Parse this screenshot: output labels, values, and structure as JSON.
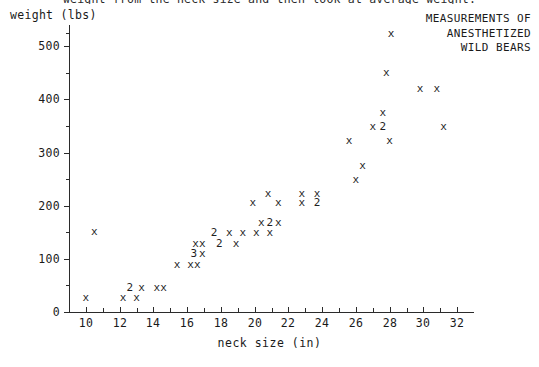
{
  "caption": {
    "clipped_line": "weight from the neck size and then look at average weight."
  },
  "axes": {
    "y_title": "weight (lbs)",
    "x_title": "neck size (in)",
    "y_major_labels": [
      "0",
      "100",
      "200",
      "300",
      "400",
      "500"
    ],
    "x_major_labels": [
      "10",
      "12",
      "14",
      "16",
      "18",
      "20",
      "22",
      "24",
      "26",
      "28",
      "30",
      "32"
    ]
  },
  "title": {
    "line1": "MEASUREMENTS OF",
    "line2": "ANESTHETIZED",
    "line3": "WILD BEARS",
    "legend_marker": "x"
  },
  "chart_data": {
    "type": "scatter",
    "xlabel": "neck size (in)",
    "ylabel": "weight (lbs)",
    "xlim": [
      9,
      33
    ],
    "ylim": [
      0,
      540
    ],
    "grid": false,
    "legend_position": "top-right",
    "marker_symbol": "x",
    "overlap_notation": "A digit (2 or 3) marks that many coincident points",
    "x_ticks": [
      10,
      12,
      14,
      16,
      18,
      20,
      22,
      24,
      26,
      28,
      30,
      32
    ],
    "x_minor_ticks": [
      11,
      13,
      15,
      17,
      19,
      21,
      23,
      25,
      27,
      29,
      31
    ],
    "y_ticks": [
      0,
      100,
      200,
      300,
      400,
      500
    ],
    "y_minor_ticks": [
      50,
      150,
      250,
      350,
      450,
      525
    ],
    "points": [
      {
        "x": 10.0,
        "y": 26,
        "label": "x",
        "count": 1
      },
      {
        "x": 10.5,
        "y": 150,
        "label": "x",
        "count": 1
      },
      {
        "x": 12.2,
        "y": 26,
        "label": "x",
        "count": 1
      },
      {
        "x": 13.0,
        "y": 26,
        "label": "x",
        "count": 1
      },
      {
        "x": 12.6,
        "y": 46,
        "label": "2",
        "count": 2
      },
      {
        "x": 13.3,
        "y": 46,
        "label": "x",
        "count": 1
      },
      {
        "x": 14.2,
        "y": 46,
        "label": "x",
        "count": 1
      },
      {
        "x": 14.6,
        "y": 46,
        "label": "x",
        "count": 1
      },
      {
        "x": 15.4,
        "y": 88,
        "label": "x",
        "count": 1
      },
      {
        "x": 16.2,
        "y": 88,
        "label": "x",
        "count": 1
      },
      {
        "x": 16.6,
        "y": 88,
        "label": "x",
        "count": 1
      },
      {
        "x": 16.4,
        "y": 110,
        "label": "3",
        "count": 3
      },
      {
        "x": 16.9,
        "y": 110,
        "label": "x",
        "count": 1
      },
      {
        "x": 16.5,
        "y": 128,
        "label": "x",
        "count": 1
      },
      {
        "x": 16.9,
        "y": 128,
        "label": "x",
        "count": 1
      },
      {
        "x": 17.9,
        "y": 128,
        "label": "2",
        "count": 2
      },
      {
        "x": 18.9,
        "y": 128,
        "label": "x",
        "count": 1
      },
      {
        "x": 17.6,
        "y": 148,
        "label": "2",
        "count": 2
      },
      {
        "x": 18.5,
        "y": 148,
        "label": "x",
        "count": 1
      },
      {
        "x": 19.3,
        "y": 148,
        "label": "x",
        "count": 1
      },
      {
        "x": 20.1,
        "y": 148,
        "label": "x",
        "count": 1
      },
      {
        "x": 20.9,
        "y": 148,
        "label": "x",
        "count": 1
      },
      {
        "x": 20.4,
        "y": 168,
        "label": "x",
        "count": 1
      },
      {
        "x": 20.9,
        "y": 168,
        "label": "2",
        "count": 2
      },
      {
        "x": 21.4,
        "y": 168,
        "label": "x",
        "count": 1
      },
      {
        "x": 19.9,
        "y": 205,
        "label": "x",
        "count": 1
      },
      {
        "x": 21.4,
        "y": 205,
        "label": "x",
        "count": 1
      },
      {
        "x": 22.8,
        "y": 205,
        "label": "x",
        "count": 1
      },
      {
        "x": 23.7,
        "y": 205,
        "label": "2",
        "count": 2
      },
      {
        "x": 20.8,
        "y": 222,
        "label": "x",
        "count": 1
      },
      {
        "x": 22.8,
        "y": 222,
        "label": "x",
        "count": 1
      },
      {
        "x": 23.7,
        "y": 222,
        "label": "x",
        "count": 1
      },
      {
        "x": 26.0,
        "y": 248,
        "label": "x",
        "count": 1
      },
      {
        "x": 26.4,
        "y": 275,
        "label": "x",
        "count": 1
      },
      {
        "x": 25.6,
        "y": 322,
        "label": "x",
        "count": 1
      },
      {
        "x": 28.0,
        "y": 322,
        "label": "x",
        "count": 1
      },
      {
        "x": 27.0,
        "y": 348,
        "label": "x",
        "count": 1
      },
      {
        "x": 27.6,
        "y": 348,
        "label": "2",
        "count": 2
      },
      {
        "x": 31.2,
        "y": 348,
        "label": "x",
        "count": 1
      },
      {
        "x": 27.6,
        "y": 375,
        "label": "x",
        "count": 1
      },
      {
        "x": 29.8,
        "y": 420,
        "label": "x",
        "count": 1
      },
      {
        "x": 30.8,
        "y": 420,
        "label": "x",
        "count": 1
      },
      {
        "x": 27.8,
        "y": 450,
        "label": "x",
        "count": 1
      }
    ]
  }
}
